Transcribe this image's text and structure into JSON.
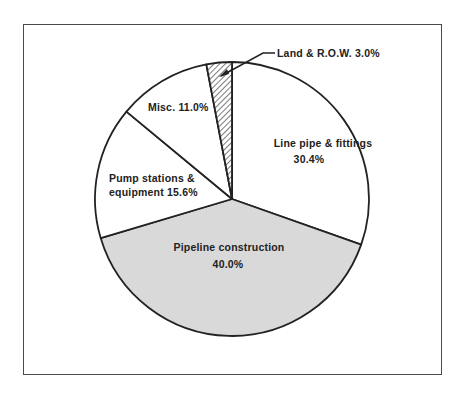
{
  "chart_data": {
    "type": "pie",
    "title": "",
    "start_angle_deg": 0,
    "direction": "clockwise",
    "slices": [
      {
        "label": "Line pipe & fittings",
        "value": 30.4,
        "display": "30.4%",
        "fill": "#ffffff",
        "pattern": "none"
      },
      {
        "label": "Pipeline construction",
        "value": 40.0,
        "display": "40.0%",
        "fill": "#d9d9d9",
        "pattern": "none"
      },
      {
        "label": "Pump stations & equipment",
        "value": 15.6,
        "display": "15.6%",
        "fill": "#ffffff",
        "pattern": "none"
      },
      {
        "label": "Misc.",
        "value": 11.0,
        "display": "11.0%",
        "fill": "#ffffff",
        "pattern": "none"
      },
      {
        "label": "Land & R.O.W.",
        "value": 3.0,
        "display": "3.0%",
        "fill": "#ffffff",
        "pattern": "diagonal-hatch"
      }
    ],
    "annotations": [
      {
        "text": "Land & R.O.W. 3.0%",
        "type": "leader-line-label"
      }
    ]
  },
  "labels": {
    "line_pipe_1": "Line pipe & fittings",
    "line_pipe_2": "30.4%",
    "pipeline_1": "Pipeline construction",
    "pipeline_2": "40.0%",
    "pump_1": "Pump stations &",
    "pump_2": "equipment 15.6%",
    "misc": "Misc. 11.0%",
    "land": "Land & R.O.W. 3.0%"
  },
  "colors": {
    "outline": "#222222",
    "shade": "#d9d9d9",
    "frame": "#4a4a4a"
  }
}
